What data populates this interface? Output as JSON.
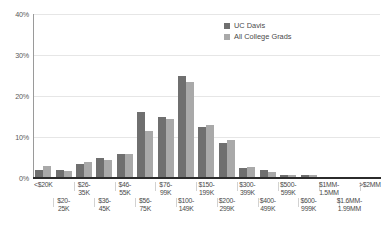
{
  "chart_data": {
    "type": "bar",
    "title": "",
    "xlabel": "",
    "ylabel": "",
    "ylim": [
      0,
      40
    ],
    "yticks": [
      0,
      10,
      20,
      30,
      40
    ],
    "ytick_labels": [
      "0%",
      "10%",
      "20%",
      "30%",
      "40%"
    ],
    "grid": true,
    "legend_position": "top-right",
    "categories": [
      "<$20K",
      "$20-25K",
      "$26-35K",
      "$36-45K",
      "$46-55K",
      "$56-75K",
      "$76-99K",
      "$100-149K",
      "$150-199K",
      "$200-299K",
      "$300-399K",
      "$400-499K",
      "$500-599K",
      "$600-999K",
      "$1MM-1.5MM",
      "$1.6MM-1.99MM",
      ">$2MM"
    ],
    "series": [
      {
        "name": "UC Davis",
        "color": "#6f6f6f",
        "values": [
          2.0,
          2.0,
          3.5,
          5.0,
          5.8,
          16.0,
          15.0,
          25.0,
          12.5,
          8.5,
          2.5,
          2.0,
          0.8,
          0.7,
          0.3,
          0.2,
          0.2
        ]
      },
      {
        "name": "All College Grads",
        "color": "#a9a9a9",
        "values": [
          3.0,
          1.8,
          3.8,
          4.3,
          5.8,
          11.5,
          14.5,
          23.5,
          13.0,
          9.2,
          2.6,
          1.4,
          0.7,
          0.8,
          0.3,
          0.2,
          0.2
        ]
      }
    ]
  },
  "legend": {
    "items": [
      {
        "label": "UC Davis"
      },
      {
        "label": "All College Grads"
      }
    ]
  },
  "axis": {
    "y_labels": [
      "40%",
      "30%",
      "20%",
      "10%",
      "0%"
    ],
    "x_labels_top": [
      "<$20K",
      "$26-\n35K",
      "$46-\n55K",
      "$76-\n99K",
      "$150-\n199K",
      "$300-\n399K",
      "$500-\n599K",
      "$1MM-\n1.5MM",
      ">$2MM"
    ],
    "x_labels_bottom": [
      "$20-\n25K",
      "$36-\n45K",
      "$56-\n75K",
      "$100-\n149K",
      "$200-\n299K",
      "$400-\n499K",
      "$600-\n999K",
      "$1.6MM-\n1.99MM"
    ],
    "x_label_rows": [
      {
        "row": 0,
        "line1": "<$20K",
        "line2": ""
      },
      {
        "row": 1,
        "line1": "$20-",
        "line2": "25K"
      },
      {
        "row": 0,
        "line1": "$26-",
        "line2": "35K"
      },
      {
        "row": 1,
        "line1": "$36-",
        "line2": "45K"
      },
      {
        "row": 0,
        "line1": "$46-",
        "line2": "55K"
      },
      {
        "row": 1,
        "line1": "$56-",
        "line2": "75K"
      },
      {
        "row": 0,
        "line1": "$76-",
        "line2": "99K"
      },
      {
        "row": 1,
        "line1": "$100-",
        "line2": "149K"
      },
      {
        "row": 0,
        "line1": "$150-",
        "line2": "199K"
      },
      {
        "row": 1,
        "line1": "$200-",
        "line2": "299K"
      },
      {
        "row": 0,
        "line1": "$300-",
        "line2": "399K"
      },
      {
        "row": 1,
        "line1": "$400-",
        "line2": "499K"
      },
      {
        "row": 0,
        "line1": "$500-",
        "line2": "599K"
      },
      {
        "row": 1,
        "line1": "$600-",
        "line2": "999K"
      },
      {
        "row": 0,
        "line1": "$1MM-",
        "line2": "1.5MM"
      },
      {
        "row": 1,
        "line1": "$1.6MM-",
        "line2": "1.99MM"
      },
      {
        "row": 0,
        "line1": ">$2MM",
        "line2": ""
      }
    ]
  },
  "colors": {
    "series0": "#6f6f6f",
    "series1": "#a9a9a9",
    "grid": "#e6e6e6",
    "axis": "#2b2b2b",
    "text": "#4a4a4a"
  }
}
